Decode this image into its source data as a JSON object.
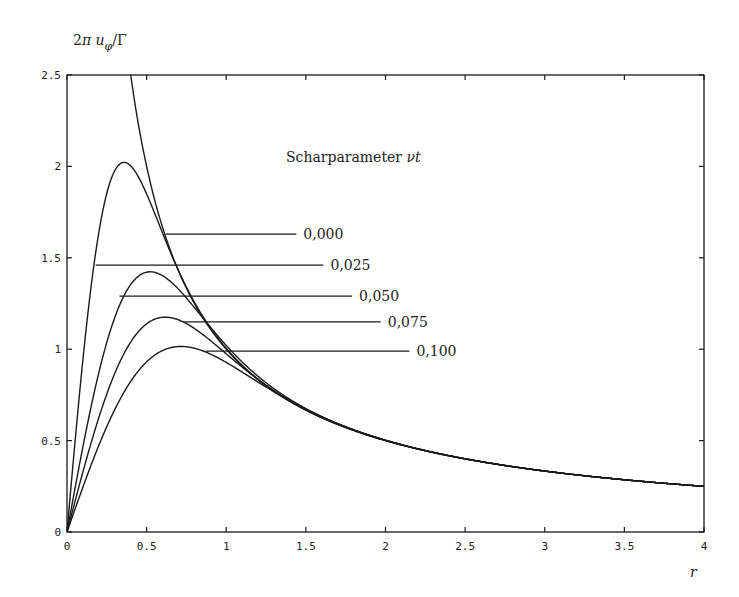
{
  "chart_data": {
    "type": "line",
    "title": "",
    "annotation": "Scharparameter νt",
    "ylabel": "2π u_φ/Γ",
    "xlabel": "r",
    "xlim": [
      0,
      4
    ],
    "ylim": [
      0,
      2.5
    ],
    "grid": false,
    "xticks": [
      0,
      0.5,
      1,
      1.5,
      2,
      2.5,
      3,
      3.5,
      4
    ],
    "xtick_labels": [
      "0",
      "0.5",
      "1",
      "1.5",
      "2",
      "2.5",
      "3",
      "3.5",
      "4"
    ],
    "yticks": [
      0,
      0.5,
      1,
      1.5,
      2,
      2.5
    ],
    "ytick_labels": [
      "0",
      "0.5",
      "1",
      "1.5",
      "2",
      "2.5"
    ],
    "series": [
      {
        "name": "0,000",
        "nu_t": 0.0,
        "peak_r": null,
        "peak_value": null,
        "x": [
          0.4,
          0.5,
          0.75,
          1,
          1.5,
          2,
          2.5,
          3,
          3.5,
          4
        ],
        "values": [
          2.5,
          2.0,
          1.333,
          1.0,
          0.667,
          0.5,
          0.4,
          0.333,
          0.286,
          0.25
        ]
      },
      {
        "name": "0,025",
        "nu_t": 0.025,
        "peak_r": 0.36,
        "peak_value": 2.03,
        "x": [
          0,
          0.1,
          0.2,
          0.36,
          0.5,
          0.75,
          1,
          1.5,
          2,
          3,
          4
        ],
        "values": [
          0,
          0.85,
          1.6,
          2.03,
          1.85,
          1.33,
          1.0,
          0.667,
          0.5,
          0.333,
          0.25
        ]
      },
      {
        "name": "0,050",
        "nu_t": 0.05,
        "peak_r": 0.53,
        "peak_value": 1.44,
        "x": [
          0,
          0.2,
          0.35,
          0.53,
          0.75,
          1,
          1.5,
          2,
          3,
          4
        ],
        "values": [
          0,
          0.85,
          1.25,
          1.44,
          1.3,
          0.99,
          0.667,
          0.5,
          0.333,
          0.25
        ]
      },
      {
        "name": "0,075",
        "nu_t": 0.075,
        "peak_r": 0.62,
        "peak_value": 1.18,
        "x": [
          0,
          0.2,
          0.4,
          0.62,
          0.85,
          1,
          1.5,
          2,
          3,
          4
        ],
        "values": [
          0,
          0.55,
          0.98,
          1.18,
          1.1,
          0.98,
          0.667,
          0.5,
          0.333,
          0.25
        ]
      },
      {
        "name": "0,100",
        "nu_t": 0.1,
        "peak_r": 0.72,
        "peak_value": 1.02,
        "x": [
          0,
          0.25,
          0.5,
          0.72,
          1,
          1.5,
          2,
          3,
          4
        ],
        "values": [
          0,
          0.5,
          0.88,
          1.02,
          0.95,
          0.665,
          0.5,
          0.333,
          0.25
        ]
      }
    ],
    "legend_leaders": [
      {
        "label": "0,000",
        "y": 1.63,
        "x_start": 0.62,
        "x_end": 1.44
      },
      {
        "label": "0,025",
        "y": 1.46,
        "x_start": 0.18,
        "x_end": 1.61
      },
      {
        "label": "0,050",
        "y": 1.29,
        "x_start": 0.33,
        "x_end": 1.79
      },
      {
        "label": "0,075",
        "y": 1.15,
        "x_start": 0.73,
        "x_end": 1.97
      },
      {
        "label": "0,100",
        "y": 0.99,
        "x_start": 0.87,
        "x_end": 2.15
      }
    ]
  },
  "plot": {
    "left_px": 67,
    "right_px": 704,
    "top_px": 75,
    "bottom_px": 532,
    "stroke": "#1a1a1a"
  }
}
